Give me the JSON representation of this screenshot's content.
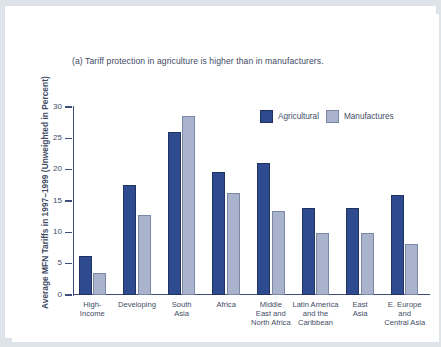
{
  "figure": {
    "title": "(a) Tariff protection in agriculture is higher than in manufacturers.",
    "y_axis_title": "Average MFN Tariffs in 1997–1999 (Unweighted in Percent)"
  },
  "colors": {
    "agricultural": "#2e4b8f",
    "manufactures": "#a9b3cc",
    "axis": "#3f4c77",
    "text": "#3f4c66",
    "background": "#ffffff",
    "page": "#dfe3ea"
  },
  "chart_data": {
    "type": "bar",
    "title": "(a) Tariff protection in agriculture is higher than in manufacturers.",
    "xlabel": "",
    "ylabel": "Average MFN Tariffs in 1997–1999 (Unweighted in Percent)",
    "ylim": [
      0,
      30
    ],
    "yticks": [
      0,
      5,
      10,
      15,
      20,
      25,
      30
    ],
    "ytick_labels": [
      "0",
      "5",
      "10",
      "15",
      "20",
      "25",
      "30"
    ],
    "grid": false,
    "legend_position": "top-right",
    "categories": [
      "High-\nIncome",
      "Developing",
      "South\nAsia",
      "Africa",
      "Middle\nEast and\nNorth Africa",
      "Latin America\nand the\nCaribbean",
      "East\nAsia",
      "E. Europe\nand\nCentral Asia"
    ],
    "category_lines": [
      [
        "High-",
        "Income"
      ],
      [
        "Developing"
      ],
      [
        "South",
        "Asia"
      ],
      [
        "Africa"
      ],
      [
        "Middle",
        "East and",
        "North Africa"
      ],
      [
        "Latin America",
        "and the",
        "Caribbean"
      ],
      [
        "East",
        "Asia"
      ],
      [
        "E. Europe",
        "and",
        "Central Asia"
      ]
    ],
    "series": [
      {
        "name": "Agricultural",
        "color": "#2e4b8f",
        "values": [
          6.2,
          17.5,
          26.0,
          19.6,
          21.0,
          13.9,
          13.9,
          15.9
        ]
      },
      {
        "name": "Manufactures",
        "color": "#a9b3cc",
        "values": [
          3.5,
          12.7,
          28.6,
          16.3,
          13.4,
          9.9,
          9.9,
          8.1
        ]
      }
    ]
  },
  "legend": {
    "items": [
      {
        "label": "Agricultural",
        "swatch": "agri"
      },
      {
        "label": "Manufactures",
        "swatch": "manu"
      }
    ]
  }
}
